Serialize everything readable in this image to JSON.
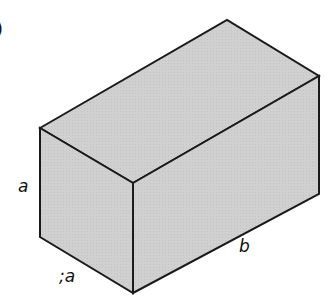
{
  "diagram": {
    "type": "rectangular-cuboid",
    "fill_color": "#d3d3d3",
    "stroke_color": "#1a1a1a",
    "partial_label": ")",
    "labels": {
      "height": "a",
      "depth": ";a",
      "length": "b"
    }
  }
}
